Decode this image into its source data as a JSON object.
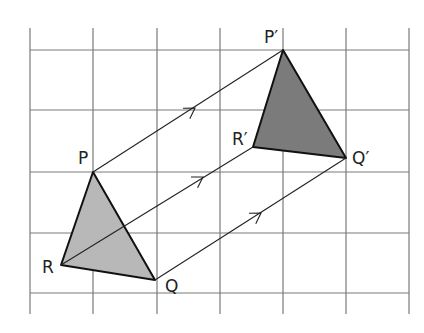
{
  "diagram": {
    "type": "translation",
    "grid": {
      "x_lines": [
        30,
        93,
        157,
        220,
        283,
        346,
        409
      ],
      "y_lines": [
        50,
        110,
        172,
        233,
        293
      ],
      "x_extent": [
        30,
        409
      ],
      "y_extent": [
        28,
        314
      ],
      "color": "#7a7a7a"
    },
    "object": {
      "name": "PQR",
      "fill": "#b8b8b8",
      "vertices": [
        {
          "id": "P",
          "label": "P",
          "x": 93,
          "y": 172,
          "lx": 78,
          "ly": 164
        },
        {
          "id": "Q",
          "label": "Q",
          "x": 155,
          "y": 280,
          "lx": 165,
          "ly": 292
        },
        {
          "id": "R",
          "label": "R",
          "x": 61,
          "y": 265,
          "lx": 42,
          "ly": 273
        }
      ]
    },
    "image": {
      "name": "P'Q'R'",
      "fill": "#7b7b7b",
      "vertices": [
        {
          "id": "P'",
          "label": "P′",
          "x": 283,
          "y": 50,
          "lx": 264,
          "ly": 43
        },
        {
          "id": "Q'",
          "label": "Q′",
          "x": 346,
          "y": 158,
          "lx": 352,
          "ly": 164
        },
        {
          "id": "R'",
          "label": "R′",
          "x": 253,
          "y": 147,
          "lx": 232,
          "ly": 145
        }
      ]
    },
    "translation_lines": [
      {
        "from": "P",
        "to": "P'",
        "x1": 93,
        "y1": 172,
        "x2": 283,
        "y2": 50,
        "arrow_x": 195,
        "arrow_y": 108
      },
      {
        "from": "R",
        "to": "R'",
        "x1": 61,
        "y1": 265,
        "x2": 253,
        "y2": 147,
        "arrow_x": 203,
        "arrow_y": 177
      },
      {
        "from": "Q",
        "to": "Q'",
        "x1": 155,
        "y1": 280,
        "x2": 346,
        "y2": 158,
        "arrow_x": 261,
        "arrow_y": 213
      }
    ]
  }
}
